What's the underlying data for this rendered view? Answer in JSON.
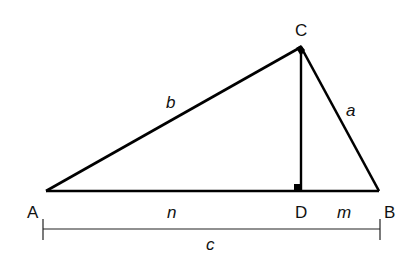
{
  "diagram": {
    "vertices": {
      "A": {
        "label": "A"
      },
      "B": {
        "label": "B"
      },
      "C": {
        "label": "C"
      },
      "D": {
        "label": "D"
      }
    },
    "sides": {
      "b": "b",
      "a": "a",
      "n": "n",
      "m": "m",
      "c": "c"
    },
    "right_angles": [
      "C",
      "D"
    ],
    "line_color": "#000000"
  }
}
